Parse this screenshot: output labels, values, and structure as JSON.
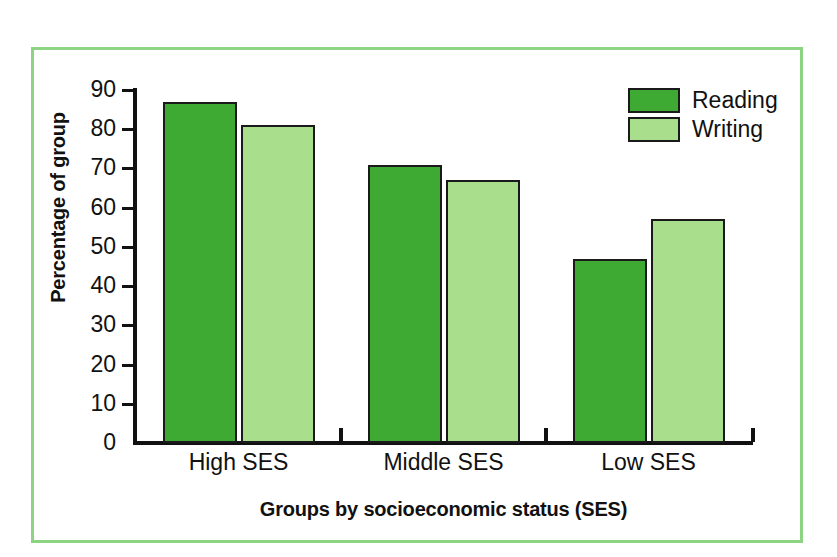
{
  "chart_data": {
    "type": "bar",
    "title": "",
    "subtitle": "",
    "categories": [
      "High SES",
      "Middle SES",
      "Low SES"
    ],
    "series": [
      {
        "name": "Reading",
        "values": [
          87,
          71,
          47
        ],
        "color": "#3FAA33"
      },
      {
        "name": "Writing",
        "values": [
          81,
          67,
          57
        ],
        "color": "#A8DE8C"
      }
    ],
    "xlabel": "Groups by socioeconomic status (SES)",
    "ylabel": "Percentage of group",
    "ylim": [
      0,
      90
    ],
    "ytick_step": 10,
    "yticks": [
      0,
      10,
      20,
      30,
      40,
      50,
      60,
      70,
      80,
      90
    ],
    "ytick_labels": [
      "0",
      "10",
      "20",
      "30",
      "40",
      "50",
      "60",
      "70",
      "80",
      "90"
    ],
    "grid": false,
    "legend_position": "top-right",
    "legend_entries": [
      "Reading",
      "Writing"
    ]
  },
  "figure": {
    "frame_color": "#8DD482",
    "background_color": "#FFFFFF",
    "axis_color": "#111111",
    "bar_outline_color": "#1A1A1A"
  }
}
